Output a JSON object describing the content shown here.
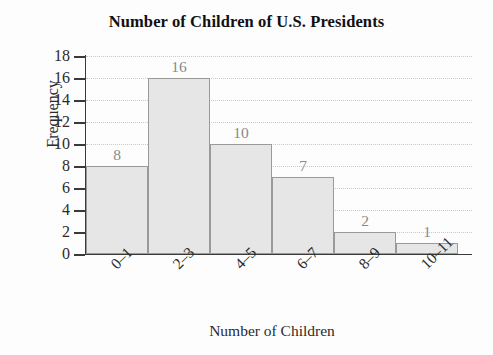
{
  "chart_data": {
    "type": "bar",
    "title": "Number of Children of U.S. Presidents",
    "xlabel": "Number of Children",
    "ylabel": "Frequency",
    "categories": [
      "0–1",
      "2–3",
      "4–5",
      "6–7",
      "8–9",
      "10–11"
    ],
    "values": [
      8,
      16,
      10,
      7,
      2,
      1
    ],
    "value_labels": [
      "8",
      "16",
      "10",
      "7",
      "2",
      "1"
    ],
    "ylim": [
      0,
      18
    ],
    "ytick_step": 2,
    "ytick_labels": [
      "18",
      "16",
      "14",
      "12",
      "10",
      "8",
      "6",
      "4",
      "2",
      "0"
    ],
    "ytick_values": [
      18,
      16,
      14,
      12,
      10,
      8,
      6,
      4,
      2,
      0
    ],
    "grid": "horizontal-dotted",
    "legend": "none",
    "bar_fill": "#e6e6e6",
    "bar_border": "#9a9a9a",
    "label_color": "#8a8a8a",
    "axis_color": "#3a3a3a"
  }
}
